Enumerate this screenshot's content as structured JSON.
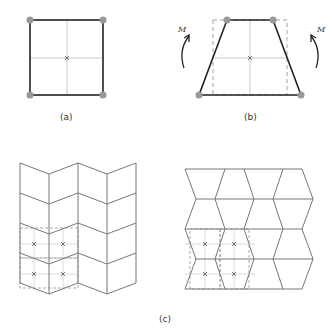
{
  "figure": {
    "panels": [
      {
        "id": "a",
        "label": "(a)",
        "description": "Undeformed square element with four corner nodes"
      },
      {
        "id": "b",
        "label": "(b)",
        "description": "Trapezoidal deformed element under bending moment M"
      },
      {
        "id": "c",
        "label": "(c)",
        "description": "Tiled meshes of deformed elements"
      }
    ],
    "moment_label_left": "M",
    "moment_label_right": "M",
    "colors": {
      "element_edge": "#222222",
      "mesh_edge": "#777777",
      "node": "#999999",
      "guide": "#bbbbbb",
      "dashed": "#999999"
    }
  }
}
